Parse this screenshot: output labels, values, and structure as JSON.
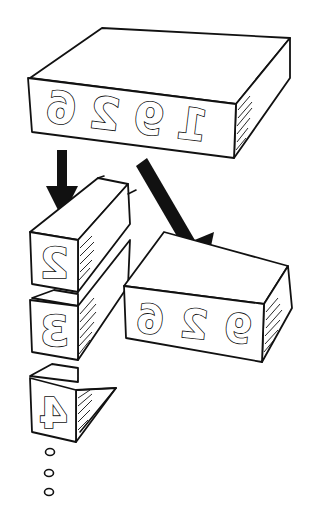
{
  "diagram": {
    "top_block": {
      "glyphs": [
        "1",
        "9",
        "2",
        "6"
      ],
      "mirrored": true
    },
    "right_block": {
      "glyphs": [
        "9",
        "2",
        "6"
      ],
      "mirrored": true
    },
    "stack_blocks": [
      {
        "glyph": "2",
        "mirrored": true
      },
      {
        "glyph": "3",
        "mirrored": true
      },
      {
        "glyph": "4",
        "mirrored": true
      }
    ],
    "continuation": "ellipsis-dots",
    "arrows": [
      {
        "from": "top-block",
        "to": "stack-block-2",
        "direction": "down"
      },
      {
        "from": "top-block",
        "to": "right-block",
        "direction": "down-right"
      }
    ],
    "colors": {
      "ink": "#111111",
      "background": "#ffffff"
    }
  }
}
